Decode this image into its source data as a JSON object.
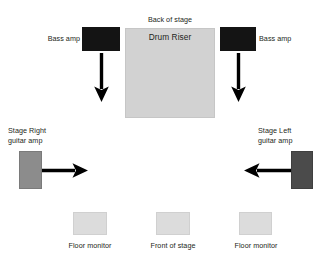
{
  "diagram": {
    "canvas": {
      "width": 321,
      "height": 262,
      "background": "#ffffff"
    },
    "labels": {
      "back_of_stage": "Back of stage",
      "front_of_stage": "Front of stage",
      "drum_riser": "Drum Riser",
      "bass_amp_left": "Bass amp",
      "bass_amp_right": "Bass amp",
      "guitar_amp_stage_right": "Stage Right\nguitar amp",
      "guitar_amp_stage_left": "Stage Left\nguitar amp",
      "floor_monitor_left": "Floor monitor",
      "floor_monitor_right": "Floor monitor"
    },
    "colors": {
      "drum_riser": "#d2d2d2",
      "bass_amp": "#141414",
      "guitar_amp_stage_right": "#8c8c8c",
      "guitar_amp_stage_left": "#4b4b4b",
      "floor_monitor": "#dcdcdc",
      "arrow": "#000000",
      "text": "#231f20"
    },
    "elements": [
      {
        "name": "drum-riser",
        "shape": "rectangle",
        "x": 125,
        "y": 28,
        "w": 90,
        "h": 90,
        "fill": "#d2d2d2"
      },
      {
        "name": "bass-amp-left",
        "shape": "rectangle",
        "x": 82,
        "y": 27,
        "w": 38,
        "h": 24,
        "fill": "#141414"
      },
      {
        "name": "bass-amp-right",
        "shape": "rectangle",
        "x": 220,
        "y": 27,
        "w": 36,
        "h": 24,
        "fill": "#141414"
      },
      {
        "name": "guitar-amp-stage-right",
        "shape": "rectangle",
        "x": 19,
        "y": 151,
        "w": 23,
        "h": 38,
        "fill": "#8c8c8c"
      },
      {
        "name": "guitar-amp-stage-left",
        "shape": "rectangle",
        "x": 291,
        "y": 151,
        "w": 22,
        "h": 38,
        "fill": "#4b4b4b"
      },
      {
        "name": "floor-monitor-left",
        "shape": "rectangle",
        "x": 73,
        "y": 212,
        "w": 34,
        "h": 23,
        "fill": "#dcdcdc"
      },
      {
        "name": "front-of-stage-marker",
        "shape": "rectangle",
        "x": 156,
        "y": 212,
        "w": 34,
        "h": 23,
        "fill": "#dcdcdc"
      },
      {
        "name": "floor-monitor-right",
        "shape": "rectangle",
        "x": 239,
        "y": 212,
        "w": 33,
        "h": 23,
        "fill": "#dcdcdc"
      }
    ],
    "arrows": [
      {
        "name": "bass-amp-left-arrow",
        "direction": "down",
        "from": [
          101,
          54
        ],
        "to": [
          101,
          101
        ]
      },
      {
        "name": "bass-amp-right-arrow",
        "direction": "down",
        "from": [
          238,
          54
        ],
        "to": [
          238,
          101
        ]
      },
      {
        "name": "guitar-amp-stage-right-arrow",
        "direction": "right",
        "from": [
          42,
          170
        ],
        "to": [
          88,
          170
        ]
      },
      {
        "name": "guitar-amp-stage-left-arrow",
        "direction": "left",
        "from": [
          290,
          170
        ],
        "to": [
          244,
          170
        ]
      }
    ]
  }
}
